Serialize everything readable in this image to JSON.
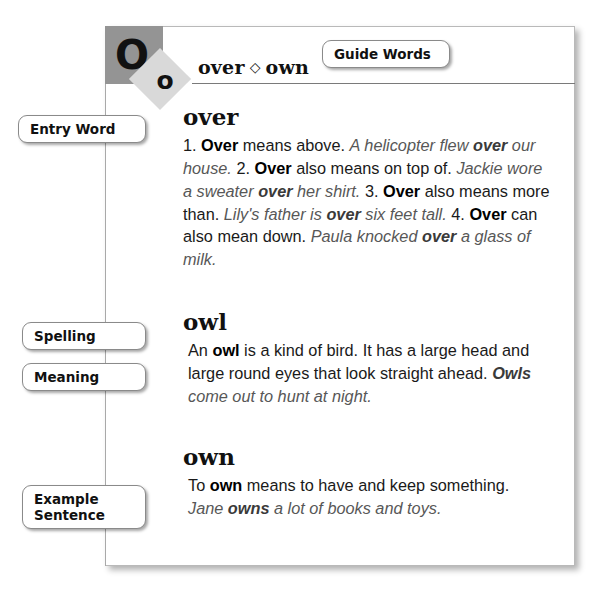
{
  "page": {
    "type": "dictionary-page-diagram",
    "background": "#ffffff",
    "sheet_border": "#b9b9b9",
    "accent_dark_gray": "#949494",
    "accent_light_gray": "#d9d9d9"
  },
  "header": {
    "corner_letter_large": "O",
    "corner_letter_small": "o",
    "guide_words_left": "over",
    "guide_words_separator": "◇",
    "guide_words_right": "own"
  },
  "callouts": {
    "guide_words": "Guide Words",
    "entry_word": "Entry Word",
    "spelling": "Spelling",
    "meaning": "Meaning",
    "example_sentence_line1": "Example",
    "example_sentence_line2": "Sentence"
  },
  "entries": [
    {
      "id": "over",
      "headword": "over",
      "definition_html": "1. <b>Over</b> means above. <i>A helicopter flew <b>over</b> our house.</i> 2. <b>Over</b> also means on top of. <i>Jackie wore a sweater <b>over</b> her shirt.</i> 3. <b>Over</b> also means more than. <i>Lily's father is <b>over</b> six feet tall.</i> 4. <b>Over</b> can also mean down. <i>Paula knocked <b>over</b> a glass of milk.</i>",
      "definition_text": "1. Over means above. A helicopter flew over our house. 2. Over also means on top of. Jackie wore a sweater over her shirt. 3. Over also means more than. Lily's father is over six feet tall. 4. Over can also mean down. Paula knocked over a glass of milk."
    },
    {
      "id": "owl",
      "headword": "owl",
      "definition_html": "An <b>owl</b> is a kind of bird. It has a large head and large round eyes that look straight ahead. <i><b>Owls</b> come out to hunt at night.</i>",
      "definition_text": "An owl is a kind of bird. It has a large head and large round eyes that look straight ahead. Owls come out to hunt at night."
    },
    {
      "id": "own",
      "headword": "own",
      "definition_html": "To <b>own</b> means to have and keep something. <i>Jane <b>owns</b> a lot of books and toys.</i>",
      "definition_text": "To own means to have and keep something. Jane owns a lot of books and toys."
    }
  ]
}
